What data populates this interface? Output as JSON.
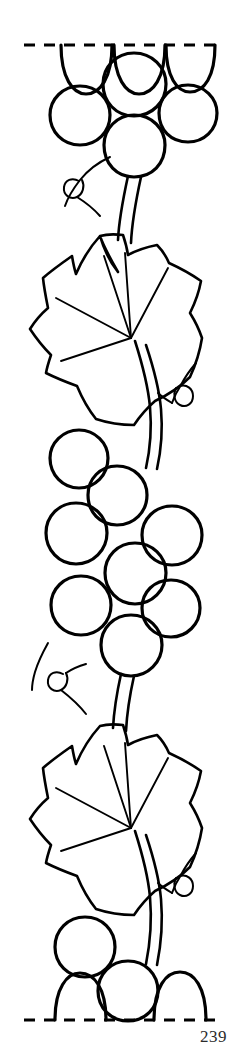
{
  "page": {
    "page_number": "239",
    "background_color": "#ffffff",
    "ink_color": "#000000",
    "width": 245,
    "height": 1056
  },
  "artwork": {
    "title": "Grapevine border pattern",
    "style": "black line art outline drawing",
    "repeat_guides": {
      "name": "dashed repeat line",
      "top_y": 45,
      "bottom_y": 1020,
      "x_start": 24,
      "x_end": 223,
      "dash_pattern": "11 9"
    },
    "elements": [
      {
        "name": "top-grape-cluster",
        "kind": "grape-cluster",
        "grape_count_full": 4,
        "grape_count_partial": 3,
        "grapes": [
          {
            "cx": 86,
            "cy": 48,
            "r": 25,
            "partial": "below-line"
          },
          {
            "cx": 139,
            "cy": 48,
            "r": 25,
            "partial": "below-line"
          },
          {
            "cx": 190,
            "cy": 48,
            "r": 24,
            "partial": "below-line"
          },
          {
            "cx": 134,
            "cy": 84,
            "r": 31,
            "partial": "none"
          },
          {
            "cx": 80,
            "cy": 115,
            "r": 29,
            "partial": "none"
          },
          {
            "cx": 188,
            "cy": 113,
            "r": 28,
            "partial": "none"
          },
          {
            "cx": 134,
            "cy": 144,
            "r": 29,
            "partial": "none"
          }
        ]
      },
      {
        "name": "top-left-tendril",
        "kind": "tendril",
        "loop_cx": 73,
        "loop_cy": 189
      },
      {
        "name": "upper-leaf",
        "kind": "ivy-leaf",
        "lobes": 5,
        "veins": 5,
        "center_x": 125,
        "center_y": 300
      },
      {
        "name": "upper-right-tendril",
        "kind": "tendril",
        "loop_cx": 181,
        "loop_cy": 394
      },
      {
        "name": "middle-grape-cluster",
        "kind": "grape-cluster",
        "grape_count_full": 7,
        "grape_count_partial": 0,
        "grapes": [
          {
            "cx": 117,
            "cy": 495,
            "r": 30,
            "partial": "none"
          },
          {
            "cx": 79,
            "cy": 458,
            "r": 29,
            "partial": "none"
          },
          {
            "cx": 76,
            "cy": 533,
            "r": 31,
            "partial": "none"
          },
          {
            "cx": 172,
            "cy": 535,
            "r": 30,
            "partial": "none"
          },
          {
            "cx": 135,
            "cy": 573,
            "r": 31,
            "partial": "none"
          },
          {
            "cx": 81,
            "cy": 605,
            "r": 30,
            "partial": "none"
          },
          {
            "cx": 171,
            "cy": 608,
            "r": 29,
            "partial": "none"
          },
          {
            "cx": 131,
            "cy": 645,
            "r": 31,
            "partial": "none"
          }
        ]
      },
      {
        "name": "middle-left-tendril",
        "kind": "tendril",
        "loop_cx": 69,
        "loop_cy": 683
      },
      {
        "name": "lower-leaf",
        "kind": "ivy-leaf",
        "lobes": 5,
        "veins": 5,
        "center_x": 125,
        "center_y": 790
      },
      {
        "name": "lower-right-tendril",
        "kind": "tendril",
        "loop_cx": 181,
        "loop_cy": 884
      },
      {
        "name": "bottom-grape-cluster",
        "kind": "grape-cluster",
        "grape_count_full": 2,
        "grape_count_partial": 2,
        "grapes": [
          {
            "cx": 85,
            "cy": 947,
            "r": 30,
            "partial": "none"
          },
          {
            "cx": 128,
            "cy": 991,
            "r": 30,
            "partial": "none"
          },
          {
            "cx": 80,
            "cy": 1020,
            "r": 25,
            "partial": "above-line"
          },
          {
            "cx": 180,
            "cy": 1020,
            "r": 26,
            "partial": "above-line"
          }
        ]
      }
    ]
  }
}
